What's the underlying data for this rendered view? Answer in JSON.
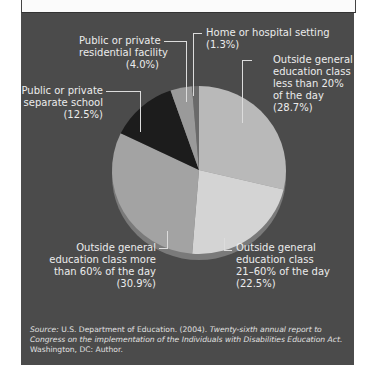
{
  "chart_data": {
    "type": "pie",
    "title": "",
    "slices": [
      {
        "label": "Outside general education class less than 20% of the day",
        "value": 28.7,
        "color": "#b9b9b9"
      },
      {
        "label": "Outside general education class 21–60% of the day",
        "value": 22.5,
        "color": "#d4d4d4"
      },
      {
        "label": "Outside general education class more than 60% of the day",
        "value": 30.9,
        "color": "#a3a3a3"
      },
      {
        "label": "Public or private separate school",
        "value": 12.5,
        "color": "#1c1c1c"
      },
      {
        "label": "Public or private residential facility",
        "value": 4.0,
        "color": "#9a9a9a"
      },
      {
        "label": "Home or hospital setting",
        "value": 1.3,
        "color": "#6a6a6a"
      }
    ],
    "legend_position": "callout labels around pie"
  },
  "labels": {
    "home": {
      "line1": "Home or hospital setting",
      "pct": "(1.3%)"
    },
    "residential": {
      "line1": "Public or private",
      "line2": "residential facility",
      "pct": "(4.0%)"
    },
    "separate": {
      "line1": "Public or private",
      "line2": "separate school",
      "pct": "(12.5%)"
    },
    "lt20": {
      "line1": "Outside general",
      "line2": "education class",
      "line3": "less than 20%",
      "line4": "of the day",
      "pct": "(28.7%)"
    },
    "gt60": {
      "line1": "Outside general",
      "line2": "education class more",
      "line3": "than 60% of the day",
      "pct": "(30.9%)"
    },
    "mid": {
      "line1": "Outside general",
      "line2": "education class",
      "line3": "21–60% of the day",
      "pct": "(22.5%)"
    }
  },
  "source": {
    "prefix": "Source:",
    "text1": " U.S. Department of Education. (2004). ",
    "title": "Twenty-sixth annual report to Congress on the implementation of the Individuals with Disabilities Education Act.",
    "text2": " Washington, DC: Author."
  }
}
